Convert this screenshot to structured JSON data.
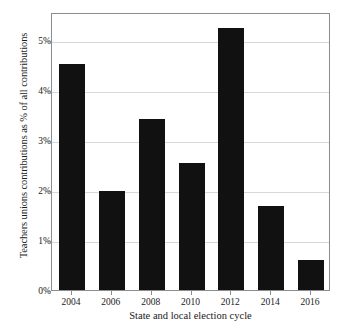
{
  "chart_data": {
    "type": "bar",
    "title": "",
    "xlabel": "State and local election cycle",
    "ylabel": "Teachers unions contributions as % of all contributions",
    "categories": [
      "2004",
      "2006",
      "2008",
      "2010",
      "2012",
      "2014",
      "2016"
    ],
    "values": [
      4.52,
      1.98,
      3.42,
      2.55,
      5.24,
      1.68,
      0.6
    ],
    "ylim": [
      0,
      5.56
    ],
    "yticks": [
      0,
      1,
      2,
      3,
      4,
      5
    ],
    "ytick_labels": [
      "0%",
      "1%",
      "2%",
      "3%",
      "4%",
      "5%"
    ],
    "grid": true,
    "grid_axis": "y",
    "legend": "none",
    "bar_color": "#111111",
    "grid_color": "#d8d8d8",
    "frame_color": "#8c8c8c",
    "background_color": "#ffffff"
  }
}
